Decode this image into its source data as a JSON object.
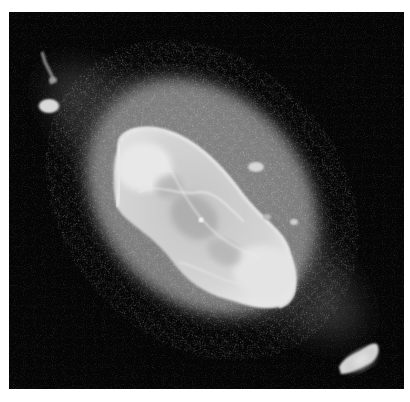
{
  "image": {
    "subject": "planetary nebula",
    "description": "Grayscale telescope image of an elongated planetary nebula with a bright inner shell, a diffuse outer halo, and two ansae (knots) at opposite ends along a diagonal axis",
    "palette": {
      "background": "#050505",
      "halo": "#6e6e6e",
      "shell": "#d8d8d8",
      "highlight": "#f2f2f2",
      "border": "#ffffff"
    },
    "features": [
      {
        "name": "outer-halo",
        "shape": "ellipse",
        "tilt_deg": -35
      },
      {
        "name": "inner-shell",
        "shape": "ellipse",
        "tilt_deg": -40
      },
      {
        "name": "ansa-top-left",
        "position": "upper-left"
      },
      {
        "name": "ansa-bottom-right",
        "position": "lower-right"
      },
      {
        "name": "jet-top-left",
        "position": "upper-left edge"
      }
    ]
  }
}
